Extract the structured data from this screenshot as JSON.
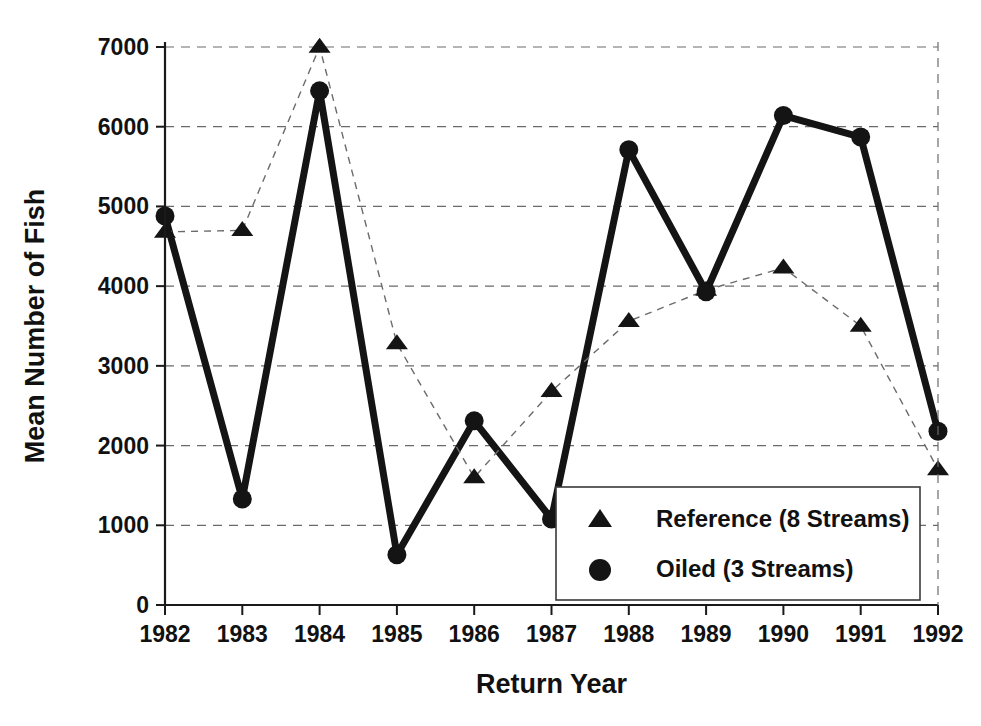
{
  "chart_data": {
    "type": "line",
    "title": "",
    "xlabel": "Return Year",
    "ylabel": "Mean Number of Fish",
    "categories": [
      "1982",
      "1983",
      "1984",
      "1985",
      "1986",
      "1987",
      "1988",
      "1989",
      "1990",
      "1991",
      "1992"
    ],
    "x": [
      1982,
      1983,
      1984,
      1985,
      1986,
      1987,
      1988,
      1989,
      1990,
      1991,
      1992
    ],
    "xlim": [
      1982,
      1992
    ],
    "ylim": [
      0,
      7000
    ],
    "yticks": [
      0,
      1000,
      2000,
      3000,
      4000,
      5000,
      6000,
      7000
    ],
    "ytick_labels": [
      "0",
      "1000",
      "2000",
      "3000",
      "4000",
      "5000",
      "6000",
      "7000"
    ],
    "grid": "horizontal-dashed",
    "legend_position": "lower-right-inside",
    "series": [
      {
        "name": "Reference (8 Streams)",
        "marker": "triangle",
        "line_style": "dashed",
        "color": "#141414",
        "values": [
          4680,
          4700,
          7000,
          3280,
          1600,
          2680,
          3560,
          3950,
          4230,
          3500,
          1700
        ]
      },
      {
        "name": "Oiled (3 Streams)",
        "marker": "circle",
        "line_style": "solid",
        "color": "#141414",
        "values": [
          4880,
          1330,
          6450,
          630,
          2310,
          1080,
          5710,
          3930,
          6140,
          5870,
          2180
        ]
      }
    ]
  },
  "legend": {
    "items": [
      {
        "marker": "triangle",
        "label": "Reference (8 Streams)"
      },
      {
        "marker": "circle",
        "label": "Oiled (3 Streams)"
      }
    ]
  },
  "colors": {
    "ink": "#141414",
    "grid": "#6a6a6a",
    "background": "#ffffff"
  }
}
